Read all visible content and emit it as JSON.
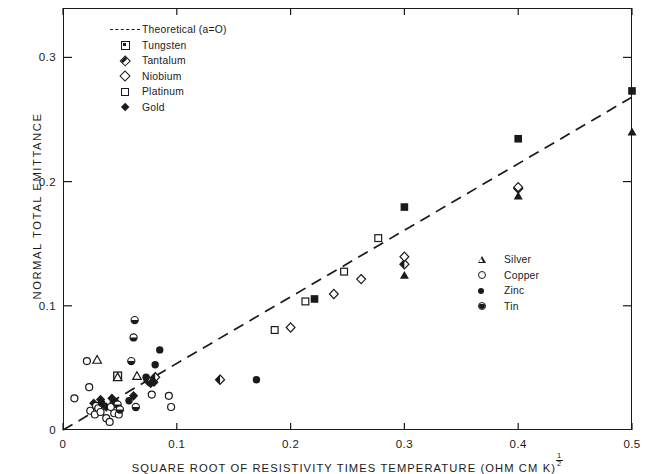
{
  "chart_data": {
    "type": "scatter",
    "title": "",
    "xlabel": "SQUARE ROOT OF RESISTIVITY TIMES TEMPERATURE (OHM CM K)",
    "xlabel_exponent": "1/2",
    "ylabel": "NORMAL TOTAL EMITTANCE",
    "xlim": [
      0,
      0.5
    ],
    "ylim": [
      0,
      0.345
    ],
    "xticks": [
      "0",
      "0.1",
      "0.2",
      "0.3",
      "0.4",
      "0.5"
    ],
    "xtick_values": [
      0,
      0.1,
      0.2,
      0.3,
      0.4,
      0.5
    ],
    "yticks": [
      "0.1",
      "0.2",
      "0.3"
    ],
    "ytick_values": [
      0.1,
      0.2,
      0.3
    ],
    "grid": false,
    "legend_position": [
      "upper-left",
      "middle-right"
    ],
    "theoretical_line": {
      "label": "Theoretical  (a=O)",
      "style": "dashed",
      "x": [
        0.0,
        0.5
      ],
      "y": [
        0.0,
        0.268
      ]
    },
    "series": [
      {
        "name": "Theoretical (a=O)",
        "marker": "dashed-line",
        "legend": "materials",
        "points": []
      },
      {
        "name": "Tungsten",
        "marker": "center-square",
        "legend": "materials",
        "points": [
          [
            0.048,
            0.0435
          ]
        ]
      },
      {
        "name": "Tantalum",
        "marker": "half-diamond",
        "legend": "materials",
        "points": [
          [
            0.075,
            0.0395
          ],
          [
            0.081,
            0.0425
          ],
          [
            0.138,
            0.0405
          ],
          [
            0.3,
            0.1335
          ],
          [
            0.4,
            0.1945
          ]
        ]
      },
      {
        "name": "Niobium",
        "marker": "open-diamond",
        "legend": "materials",
        "points": [
          [
            0.2,
            0.0825
          ],
          [
            0.238,
            0.1095
          ],
          [
            0.262,
            0.1215
          ],
          [
            0.3,
            0.1395
          ],
          [
            0.4,
            0.1955
          ]
        ]
      },
      {
        "name": "Platinum",
        "marker": "open-square",
        "legend": "materials",
        "points": [
          [
            0.186,
            0.0805
          ],
          [
            0.213,
            0.1035
          ],
          [
            0.247,
            0.1275
          ],
          [
            0.277,
            0.1545
          ]
        ]
      },
      {
        "name": "Gold",
        "marker": "filled-diamond",
        "legend": "materials",
        "points": [
          [
            0.027,
            0.0215
          ],
          [
            0.033,
            0.0245
          ],
          [
            0.038,
            0.0185
          ],
          [
            0.043,
            0.0255
          ],
          [
            0.062,
            0.0275
          ],
          [
            0.077,
            0.0375
          ],
          [
            0.08,
            0.0385
          ]
        ]
      },
      {
        "name": "Silver",
        "marker": "open-triangle",
        "legend": "metals",
        "points": [
          [
            0.03,
            0.0565
          ],
          [
            0.048,
            0.0425
          ],
          [
            0.065,
            0.0435
          ],
          [
            0.3,
            0.1245
          ],
          [
            0.4,
            0.1885
          ],
          [
            0.5,
            0.24
          ]
        ]
      },
      {
        "name": "Copper",
        "marker": "open-circle",
        "legend": "metals",
        "points": [
          [
            0.01,
            0.0255
          ],
          [
            0.021,
            0.0555
          ],
          [
            0.023,
            0.0345
          ],
          [
            0.024,
            0.0155
          ],
          [
            0.028,
            0.0125
          ],
          [
            0.029,
            0.0195
          ],
          [
            0.031,
            0.0175
          ],
          [
            0.033,
            0.0145
          ],
          [
            0.038,
            0.0095
          ],
          [
            0.041,
            0.0065
          ],
          [
            0.042,
            0.0185
          ],
          [
            0.045,
            0.0135
          ],
          [
            0.049,
            0.0125
          ],
          [
            0.078,
            0.0285
          ],
          [
            0.093,
            0.0275
          ],
          [
            0.095,
            0.0185
          ]
        ]
      },
      {
        "name": "Zinc",
        "marker": "filled-circle",
        "legend": "metals",
        "points": [
          [
            0.034,
            0.0215
          ],
          [
            0.046,
            0.0225
          ],
          [
            0.058,
            0.0235
          ],
          [
            0.073,
            0.0425
          ],
          [
            0.081,
            0.0525
          ],
          [
            0.085,
            0.0645
          ],
          [
            0.17,
            0.0405
          ]
        ]
      },
      {
        "name": "Tin",
        "marker": "half-circle",
        "legend": "metals",
        "points": [
          [
            0.048,
            0.0205
          ],
          [
            0.05,
            0.0165
          ],
          [
            0.06,
            0.0555
          ],
          [
            0.062,
            0.0745
          ],
          [
            0.063,
            0.0885
          ],
          [
            0.064,
            0.0185
          ]
        ]
      },
      {
        "name": "Unlabeled filled squares",
        "marker": "filled-square",
        "legend": "none",
        "points": [
          [
            0.221,
            0.1055
          ],
          [
            0.3,
            0.1795
          ],
          [
            0.4,
            0.2345
          ],
          [
            0.5,
            0.273
          ]
        ]
      }
    ]
  },
  "axes": {
    "x_title": "SQUARE ROOT OF RESISTIVITY TIMES TEMPERATURE (OHM CM K)",
    "x_exponent_num": "1",
    "x_exponent_den": "2",
    "y_title": "NORMAL TOTAL EMITTANCE",
    "x_tick_labels": [
      "0",
      "0.1",
      "0.2",
      "0.3",
      "0.4",
      "0.5"
    ],
    "y_tick_labels": [
      "0.1",
      "0.2",
      "0.3"
    ],
    "y_origin_label": "0"
  },
  "legend_materials": {
    "items": [
      {
        "label": "Theoretical  (a=O)",
        "marker": "dashed-line"
      },
      {
        "label": "Tungsten",
        "marker": "center-square"
      },
      {
        "label": "Tantalum",
        "marker": "half-diamond"
      },
      {
        "label": "Niobium",
        "marker": "open-diamond"
      },
      {
        "label": "Platinum",
        "marker": "open-square"
      },
      {
        "label": "Gold",
        "marker": "filled-diamond"
      }
    ]
  },
  "legend_metals": {
    "items": [
      {
        "label": "Silver",
        "marker": "open-triangle"
      },
      {
        "label": "Copper",
        "marker": "open-circle"
      },
      {
        "label": "Zinc",
        "marker": "filled-circle"
      },
      {
        "label": "Tin",
        "marker": "half-circle"
      }
    ]
  },
  "colors": {
    "ink": "#1a1a1a",
    "background": "#ffffff"
  }
}
